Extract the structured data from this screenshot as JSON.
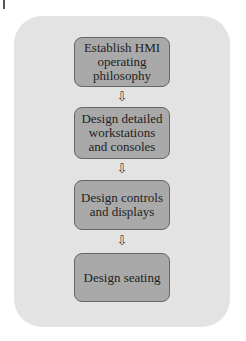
{
  "diagram": {
    "type": "flowchart",
    "direction": "top-to-bottom",
    "steps": [
      {
        "label": "Establish HMI operating philosophy"
      },
      {
        "label": "Design detailed workstations and consoles"
      },
      {
        "label": "Design controls and displays"
      },
      {
        "label": "Design seating"
      }
    ],
    "arrow_glyph": "⇩",
    "colors": {
      "panel": "#e3e3e3",
      "box": "#a9a9a9",
      "box_border": "#666666",
      "text": "#1e1e1e"
    }
  }
}
